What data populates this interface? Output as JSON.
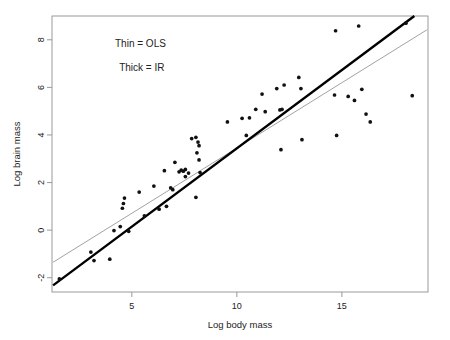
{
  "chart_data": {
    "type": "scatter",
    "title": "",
    "xlabel": "Log body mass",
    "ylabel": "Log brain mass",
    "xlim": [
      1.2,
      19.1
    ],
    "ylim": [
      -2.6,
      9.0
    ],
    "xticks": [
      5,
      10,
      15
    ],
    "xtick_labels": [
      "5",
      "10",
      "15"
    ],
    "yticks": [
      -2,
      0,
      2,
      4,
      6,
      8
    ],
    "ytick_labels": [
      "-2",
      "0",
      "2",
      "4",
      "6",
      "8"
    ],
    "grid": false,
    "legend_position": "upper-left-inside",
    "annotations": [
      {
        "text": "Thin = OLS",
        "x": 4.2,
        "y": 7.7
      },
      {
        "text": "Thick = IR",
        "x": 4.4,
        "y": 6.7
      }
    ],
    "point_color": "#111111",
    "point_size": 3,
    "points": [
      {
        "x": 1.55,
        "y": -2.05
      },
      {
        "x": 3.05,
        "y": -0.92
      },
      {
        "x": 3.2,
        "y": -1.28
      },
      {
        "x": 3.95,
        "y": -1.22
      },
      {
        "x": 4.15,
        "y": -0.02
      },
      {
        "x": 4.45,
        "y": 0.15
      },
      {
        "x": 4.55,
        "y": 0.92
      },
      {
        "x": 4.6,
        "y": 1.12
      },
      {
        "x": 4.65,
        "y": 1.35
      },
      {
        "x": 4.85,
        "y": -0.05
      },
      {
        "x": 5.35,
        "y": 1.6
      },
      {
        "x": 5.6,
        "y": 0.6
      },
      {
        "x": 6.05,
        "y": 1.85
      },
      {
        "x": 6.3,
        "y": 0.88
      },
      {
        "x": 6.55,
        "y": 2.5
      },
      {
        "x": 6.65,
        "y": 1.0
      },
      {
        "x": 6.85,
        "y": 1.78
      },
      {
        "x": 6.95,
        "y": 1.7
      },
      {
        "x": 7.05,
        "y": 2.85
      },
      {
        "x": 7.25,
        "y": 2.45
      },
      {
        "x": 7.35,
        "y": 2.52
      },
      {
        "x": 7.45,
        "y": 2.48
      },
      {
        "x": 7.55,
        "y": 2.55
      },
      {
        "x": 7.55,
        "y": 2.25
      },
      {
        "x": 7.7,
        "y": 2.4
      },
      {
        "x": 7.85,
        "y": 3.85
      },
      {
        "x": 8.05,
        "y": 3.9
      },
      {
        "x": 8.1,
        "y": 3.25
      },
      {
        "x": 8.15,
        "y": 3.7
      },
      {
        "x": 8.2,
        "y": 3.55
      },
      {
        "x": 8.2,
        "y": 2.95
      },
      {
        "x": 8.25,
        "y": 2.42
      },
      {
        "x": 8.05,
        "y": 1.38
      },
      {
        "x": 9.55,
        "y": 4.55
      },
      {
        "x": 10.25,
        "y": 4.7
      },
      {
        "x": 10.45,
        "y": 3.98
      },
      {
        "x": 10.6,
        "y": 4.72
      },
      {
        "x": 10.9,
        "y": 5.08
      },
      {
        "x": 11.2,
        "y": 5.72
      },
      {
        "x": 11.35,
        "y": 4.98
      },
      {
        "x": 11.9,
        "y": 5.95
      },
      {
        "x": 12.05,
        "y": 5.05
      },
      {
        "x": 12.15,
        "y": 5.08
      },
      {
        "x": 12.25,
        "y": 6.1
      },
      {
        "x": 12.1,
        "y": 3.38
      },
      {
        "x": 12.95,
        "y": 6.42
      },
      {
        "x": 13.05,
        "y": 5.95
      },
      {
        "x": 13.1,
        "y": 3.8
      },
      {
        "x": 14.65,
        "y": 5.68
      },
      {
        "x": 14.7,
        "y": 8.38
      },
      {
        "x": 14.75,
        "y": 3.98
      },
      {
        "x": 15.3,
        "y": 5.62
      },
      {
        "x": 15.6,
        "y": 5.45
      },
      {
        "x": 15.8,
        "y": 8.58
      },
      {
        "x": 15.95,
        "y": 5.92
      },
      {
        "x": 16.15,
        "y": 4.88
      },
      {
        "x": 16.35,
        "y": 4.55
      },
      {
        "x": 18.05,
        "y": 8.7
      },
      {
        "x": 18.35,
        "y": 5.65
      }
    ],
    "lines": [
      {
        "name": "OLS",
        "label": "Thin = OLS",
        "style": "thin",
        "color": "#8a8a8a",
        "width": 0.8,
        "x0": 1.25,
        "y0": -1.35,
        "x1": 19.05,
        "y1": 8.42
      },
      {
        "name": "IR",
        "label": "Thick = IR",
        "style": "thick",
        "color": "#000000",
        "width": 2.4,
        "x0": 1.25,
        "y0": -2.32,
        "x1": 18.45,
        "y1": 9.0
      }
    ]
  },
  "plot": {
    "frame_color": "#999999",
    "background": "#ffffff"
  }
}
